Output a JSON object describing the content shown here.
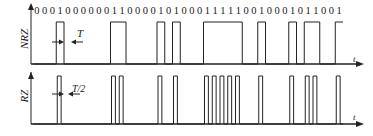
{
  "diagram": {
    "bit_sequence": "0001000000110000101000111110010001011001",
    "nrz": {
      "label": "NRZ",
      "bit_period_label": "T",
      "axis_label": "t"
    },
    "rz": {
      "label": "RZ",
      "pulse_width_label": "T/2",
      "axis_label": "t"
    },
    "colors": {
      "line": "#222222",
      "background": "#ffffff"
    }
  }
}
